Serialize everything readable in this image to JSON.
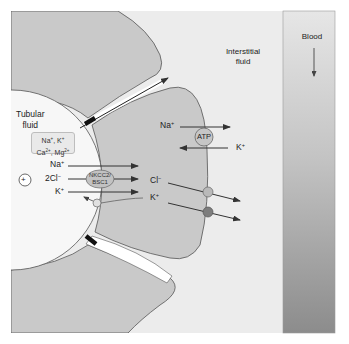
{
  "figure": {
    "compartments": {
      "lumen": {
        "label_line1": "Tubular",
        "label_line2": "fluid"
      },
      "interstitium": {
        "label_line1": "Interstitial",
        "label_line2": "fluid"
      },
      "blood": {
        "label": "Blood",
        "flow_direction": "down"
      }
    },
    "paracellular_cations": {
      "line1": [
        "Na",
        "+",
        ", K",
        "+"
      ],
      "line2": [
        "Ca",
        "2+",
        ", Mg",
        "2+"
      ]
    },
    "lumen_potential": {
      "symbol": "+"
    },
    "apical_transport": {
      "transporter_line1": "NKCC2/",
      "transporter_line2": "BSC1",
      "ions": [
        {
          "name": "Na",
          "charge": "+",
          "stoich": ""
        },
        {
          "name": "Cl",
          "charge": "−",
          "stoich": "2"
        },
        {
          "name": "K",
          "charge": "+",
          "stoich": ""
        }
      ]
    },
    "basolateral_pump": {
      "label": "ATP",
      "ions_out": {
        "name": "Na",
        "charge": "+"
      },
      "ions_in": {
        "name": "K",
        "charge": "+"
      }
    },
    "basolateral_channels": [
      {
        "name": "Cl",
        "charge": "−",
        "color": "#b9b9b9"
      },
      {
        "name": "K",
        "charge": "+",
        "color": "#7d7d7d"
      }
    ],
    "colors": {
      "background": "#ececec",
      "cell": "#c9c9c9",
      "lumen": "#f7f7f7",
      "blood_top": "#e4e4e4",
      "blood_bottom": "#8e8e8e",
      "outline": "#555555",
      "arrow": "#333333"
    }
  }
}
